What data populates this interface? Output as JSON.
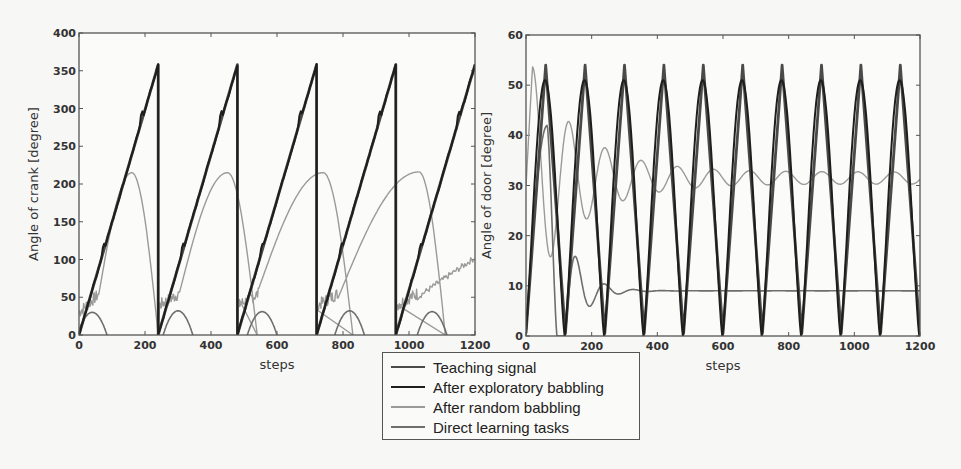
{
  "legend": {
    "items": [
      {
        "label": "Teaching signal",
        "color": "#4a4a4a",
        "width": 2.2
      },
      {
        "label": "After exploratory babbling",
        "color": "#1e1e1e",
        "width": 2.0
      },
      {
        "label": "After random babbling",
        "color": "#9a9a9a",
        "width": 1.4
      },
      {
        "label": "Direct learning tasks",
        "color": "#6e6e6e",
        "width": 1.6
      }
    ]
  },
  "chart_data": [
    {
      "type": "line",
      "title": "",
      "xlabel": "steps",
      "ylabel": "Angle of crank [degree]",
      "xlim": [
        0,
        1200
      ],
      "ylim": [
        0,
        400
      ],
      "xticks": [
        0,
        200,
        400,
        600,
        800,
        1000,
        1200
      ],
      "yticks": [
        0,
        50,
        100,
        150,
        200,
        250,
        300,
        350,
        400
      ],
      "grid": false,
      "plot_box": {
        "x0": 79,
        "y0": 33,
        "x1": 475,
        "y1": 335
      },
      "params": {
        "period": 240,
        "sawtooth_max": 358,
        "direct_arcs": [
          {
            "center": 40,
            "half_width": 45,
            "peak": 30
          },
          {
            "center": 300,
            "half_width": 45,
            "peak": 32
          },
          {
            "center": 555,
            "half_width": 45,
            "peak": 31
          },
          {
            "center": 820,
            "half_width": 45,
            "peak": 32
          },
          {
            "center": 1070,
            "half_width": 45,
            "peak": 31
          }
        ],
        "random_peaks": [
          {
            "x": 160,
            "peak": 215
          },
          {
            "x": 450,
            "peak": 215
          },
          {
            "x": 740,
            "peak": 215
          },
          {
            "x": 1030,
            "peak": 216
          }
        ]
      },
      "series": [
        {
          "name": "Teaching signal",
          "x": [
            0,
            240,
            240,
            480,
            480,
            720,
            720,
            960,
            960,
            1200
          ],
          "values": [
            0,
            358,
            0,
            358,
            0,
            358,
            0,
            358,
            0,
            358
          ]
        },
        {
          "name": "After exploratory babbling",
          "x": [
            0,
            240,
            240,
            480,
            480,
            720,
            720,
            960,
            960,
            1200
          ],
          "values": [
            0,
            358,
            0,
            358,
            0,
            358,
            0,
            358,
            0,
            355
          ]
        },
        {
          "name": "After random babbling",
          "x": [
            0,
            50,
            160,
            240,
            250,
            450,
            480,
            540,
            740,
            830,
            1030,
            1110,
            1200
          ],
          "values": [
            30,
            100,
            215,
            0,
            45,
            215,
            185,
            0,
            215,
            0,
            216,
            0,
            85
          ]
        },
        {
          "name": "Direct learning tasks",
          "x": [
            0,
            40,
            85,
            255,
            300,
            345,
            510,
            555,
            600,
            775,
            820,
            865,
            1025,
            1070,
            1115
          ],
          "values": [
            0,
            30,
            0,
            0,
            32,
            0,
            0,
            31,
            0,
            0,
            32,
            0,
            0,
            31,
            0
          ]
        }
      ]
    },
    {
      "type": "line",
      "title": "",
      "xlabel": "steps",
      "ylabel": "Angle of door [degree]",
      "xlim": [
        0,
        1200
      ],
      "ylim": [
        0,
        60
      ],
      "xticks": [
        0,
        200,
        400,
        600,
        800,
        1000,
        1200
      ],
      "yticks": [
        0,
        10,
        20,
        30,
        40,
        50,
        60
      ],
      "grid": false,
      "plot_box": {
        "x0": 526,
        "y0": 35,
        "x1": 920,
        "y1": 336
      },
      "params": {
        "period": 120,
        "teach_min": 0.5,
        "teach_max": 54,
        "explore_max": 51,
        "random_settle": 31.5,
        "direct_settle": 9
      },
      "series": [
        {
          "name": "Teaching signal",
          "x": [
            0,
            60,
            120,
            180,
            240,
            300,
            360,
            420,
            480,
            540,
            600,
            660,
            720,
            780,
            840,
            900,
            960,
            1020,
            1080,
            1140,
            1200
          ],
          "values": [
            0.5,
            54,
            1,
            54,
            0.5,
            54,
            1,
            54,
            0.5,
            54,
            1,
            54,
            0.5,
            54,
            1,
            54,
            0.5,
            54,
            1,
            54,
            5
          ]
        },
        {
          "name": "After exploratory babbling",
          "x": [
            0,
            65,
            125,
            185,
            245,
            305,
            365,
            425,
            485,
            545,
            605,
            665,
            725,
            785,
            845,
            905,
            965,
            1030,
            1095,
            1160,
            1200
          ],
          "values": [
            0,
            51,
            2,
            51,
            1,
            51,
            1,
            51,
            0.5,
            51,
            1,
            51,
            0.5,
            51,
            1,
            51,
            0.5,
            50,
            1,
            50,
            10
          ]
        },
        {
          "name": "After random babbling",
          "x": [
            0,
            20,
            100,
            170,
            230,
            275,
            335,
            380,
            440,
            480,
            540,
            590,
            640,
            700,
            740,
            800,
            850,
            900,
            960,
            1010,
            1080,
            1150,
            1200
          ],
          "values": [
            30,
            54,
            4,
            45,
            22,
            39.5,
            25,
            37,
            27,
            35,
            28.5,
            34,
            29.5,
            33,
            30,
            32.5,
            30.5,
            32.5,
            31,
            32,
            31.5,
            31.5,
            31.5
          ]
        },
        {
          "name": "Direct learning tasks",
          "x": [
            0,
            65,
            100,
            180,
            230,
            270,
            300,
            400,
            600,
            800,
            1000,
            1200
          ],
          "values": [
            0,
            42,
            4,
            14,
            8,
            10,
            9,
            9,
            9,
            9,
            9,
            9
          ]
        }
      ]
    }
  ]
}
